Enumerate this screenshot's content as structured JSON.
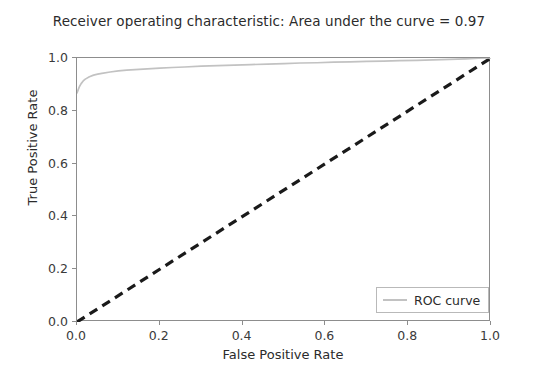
{
  "chart_data": {
    "type": "line",
    "title": "Receiver operating characteristic: Area under the curve = 0.97",
    "xlabel": "False Positive Rate",
    "ylabel": "True Positive Rate",
    "xlim": [
      0.0,
      1.0
    ],
    "ylim": [
      0.0,
      1.0
    ],
    "grid": false,
    "legend_position": "lower right",
    "auc": 0.97,
    "xticks": [
      "0.0",
      "0.2",
      "0.4",
      "0.6",
      "0.8",
      "1.0"
    ],
    "xtick_values": [
      0.0,
      0.2,
      0.4,
      0.6,
      0.8,
      1.0
    ],
    "yticks": [
      "0.0",
      "0.2",
      "0.4",
      "0.6",
      "0.8",
      "1.0"
    ],
    "ytick_values": [
      0.0,
      0.2,
      0.4,
      0.6,
      0.8,
      1.0
    ],
    "series": [
      {
        "name": "ROC curve",
        "style": "solid",
        "color": "#c2c2c2",
        "x": [
          0.0,
          0.003,
          0.006,
          0.01,
          0.015,
          0.02,
          0.03,
          0.04,
          0.05,
          0.06,
          0.08,
          0.1,
          0.12,
          0.14,
          0.16,
          0.18,
          0.2,
          0.23,
          0.26,
          0.3,
          0.34,
          0.38,
          0.42,
          0.46,
          0.5,
          0.54,
          0.58,
          0.62,
          0.66,
          0.7,
          0.74,
          0.78,
          0.82,
          0.86,
          0.9,
          0.94,
          0.97,
          1.0
        ],
        "y": [
          0.868,
          0.88,
          0.892,
          0.903,
          0.913,
          0.92,
          0.929,
          0.935,
          0.939,
          0.942,
          0.947,
          0.951,
          0.954,
          0.956,
          0.958,
          0.96,
          0.962,
          0.964,
          0.966,
          0.969,
          0.971,
          0.973,
          0.975,
          0.977,
          0.979,
          0.981,
          0.982,
          0.984,
          0.985,
          0.987,
          0.988,
          0.99,
          0.991,
          0.993,
          0.995,
          0.997,
          0.999,
          1.0
        ]
      },
      {
        "name": "chance-diagonal",
        "style": "dashed",
        "color": "#1a1a1a",
        "x": [
          0.0,
          1.0
        ],
        "y": [
          0.0,
          1.0
        ]
      }
    ]
  },
  "legend": {
    "entries": [
      {
        "label": "ROC curve",
        "color": "#c2c2c2"
      }
    ]
  }
}
